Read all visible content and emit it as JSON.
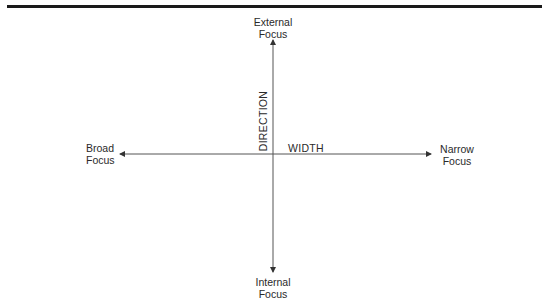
{
  "diagram": {
    "type": "quadrant-axes",
    "axes": {
      "vertical": {
        "name": "DIRECTION",
        "top_label": [
          "External",
          "Focus"
        ],
        "bottom_label": [
          "Internal",
          "Focus"
        ]
      },
      "horizontal": {
        "name": "WIDTH",
        "left_label": [
          "Broad",
          "Focus"
        ],
        "right_label": [
          "Narrow",
          "Focus"
        ]
      }
    },
    "colors": {
      "rule": "#1a1a1a",
      "axis_line": "#555555",
      "text": "#2a2a2a"
    }
  }
}
